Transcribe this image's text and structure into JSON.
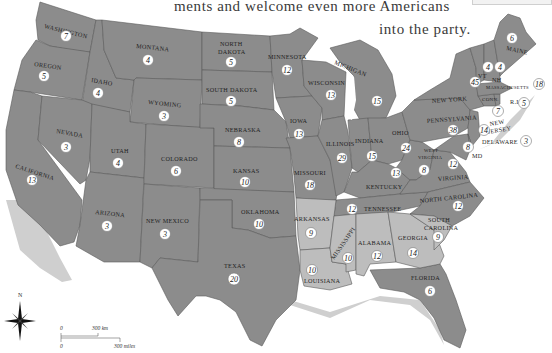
{
  "caption": {
    "line1": "ments and welcome even more Americans",
    "line2": "into the party."
  },
  "colors": {
    "dark_state": "#8c8c8c",
    "light_state": "#bdbdbd",
    "border": "#5a5a5a",
    "coast_shadow": "#c8c8c8",
    "background": "#ffffff"
  },
  "states": [
    {
      "name": "WASHINGTON",
      "votes": "7",
      "shade": "dark"
    },
    {
      "name": "OREGON",
      "votes": "5",
      "shade": "dark"
    },
    {
      "name": "CALIFORNIA",
      "votes": "13",
      "shade": "dark"
    },
    {
      "name": "IDAHO",
      "votes": "4",
      "shade": "dark"
    },
    {
      "name": "NEVADA",
      "votes": "3",
      "shade": "dark"
    },
    {
      "name": "MONTANA",
      "votes": "4",
      "shade": "dark"
    },
    {
      "name": "WYOMING",
      "votes": "3",
      "shade": "dark"
    },
    {
      "name": "UTAH",
      "votes": "4",
      "shade": "dark"
    },
    {
      "name": "ARIZONA",
      "votes": "3",
      "shade": "dark"
    },
    {
      "name": "COLORADO",
      "votes": "6",
      "shade": "dark"
    },
    {
      "name": "NEW MEXICO",
      "votes": "3",
      "shade": "dark"
    },
    {
      "name": "NORTH DAKOTA",
      "votes": "5",
      "shade": "dark"
    },
    {
      "name": "SOUTH DAKOTA",
      "votes": "5",
      "shade": "dark"
    },
    {
      "name": "NEBRASKA",
      "votes": "8",
      "shade": "dark"
    },
    {
      "name": "KANSAS",
      "votes": "10",
      "shade": "dark"
    },
    {
      "name": "OKLAHOMA",
      "votes": "10",
      "shade": "dark"
    },
    {
      "name": "TEXAS",
      "votes": "20",
      "shade": "dark"
    },
    {
      "name": "MINNESOTA",
      "votes": "12",
      "shade": "dark"
    },
    {
      "name": "IOWA",
      "votes": "13",
      "shade": "dark"
    },
    {
      "name": "MISSOURI",
      "votes": "18",
      "shade": "dark"
    },
    {
      "name": "ARKANSAS",
      "votes": "9",
      "shade": "light"
    },
    {
      "name": "LOUISIANA",
      "votes": "10",
      "shade": "light"
    },
    {
      "name": "WISCONSIN",
      "votes": "13",
      "shade": "dark"
    },
    {
      "name": "ILLINOIS",
      "votes": "29",
      "shade": "dark"
    },
    {
      "name": "MISSISSIPPI",
      "votes": "10",
      "shade": "light"
    },
    {
      "name": "MICHIGAN",
      "votes": "15",
      "shade": "dark"
    },
    {
      "name": "INDIANA",
      "votes": "15",
      "shade": "dark"
    },
    {
      "name": "KENTUCKY",
      "votes": "13",
      "shade": "dark"
    },
    {
      "name": "TENNESSEE",
      "votes": "12",
      "shade": "dark"
    },
    {
      "name": "ALABAMA",
      "votes": "12",
      "shade": "light"
    },
    {
      "name": "OHIO",
      "votes": "24",
      "shade": "dark"
    },
    {
      "name": "WEST VIRGINIA",
      "votes": "8",
      "shade": "dark"
    },
    {
      "name": "GEORGIA",
      "votes": "14",
      "shade": "light"
    },
    {
      "name": "FLORIDA",
      "votes": "6",
      "shade": "dark"
    },
    {
      "name": "SOUTH CAROLINA",
      "votes": "9",
      "shade": "light"
    },
    {
      "name": "NORTH CAROLINA",
      "votes": "12",
      "shade": "dark"
    },
    {
      "name": "VIRGINIA",
      "votes": "12",
      "shade": "dark"
    },
    {
      "name": "PENNSYLVANIA",
      "votes": "38",
      "shade": "dark"
    },
    {
      "name": "NEW YORK",
      "votes": "45",
      "shade": "dark"
    },
    {
      "name": "MD",
      "votes": "8",
      "shade": "dark"
    },
    {
      "name": "NEW JERSEY",
      "votes": "14",
      "shade": "dark"
    },
    {
      "name": "DELAWARE",
      "votes": "3",
      "shade": "dark"
    },
    {
      "name": "CONN.",
      "votes": "7",
      "shade": "dark"
    },
    {
      "name": "R.I.",
      "votes": "5",
      "shade": "dark"
    },
    {
      "name": "MASSACHUSETTS",
      "votes": "18",
      "shade": "dark"
    },
    {
      "name": "VT",
      "votes": "4",
      "shade": "dark"
    },
    {
      "name": "NH",
      "votes": "4",
      "shade": "dark"
    },
    {
      "name": "MAINE",
      "votes": "6",
      "shade": "dark"
    }
  ],
  "labels": {
    "wa": "WASHINGTON",
    "or": "OREGON",
    "ca": "CALIFORNIA",
    "id": "IDAHO",
    "nv": "NEVADA",
    "mt": "MONTANA",
    "wy": "WYOMING",
    "ut": "UTAH",
    "az": "ARIZONA",
    "co": "COLORADO",
    "nm": "NEW MEXICO",
    "nd1": "NORTH",
    "nd2": "DAKOTA",
    "sd": "SOUTH DAKOTA",
    "ne": "NEBRASKA",
    "ks": "KANSAS",
    "ok": "OKLAHOMA",
    "tx": "TEXAS",
    "mn": "MINNESOTA",
    "ia": "IOWA",
    "mo": "MISSOURI",
    "ar": "ARKANSAS",
    "la": "LOUISIANA",
    "wi": "WISCONSIN",
    "il": "ILLINOIS",
    "ms": "MISSISSIPPI",
    "mi": "MICHIGAN",
    "in": "INDIANA",
    "ky": "KENTUCKY",
    "tn": "TENNESSEE",
    "al": "ALABAMA",
    "oh": "OHIO",
    "wv1": "WEST",
    "wv2": "VIRGINIA",
    "ga": "GEORGIA",
    "fl": "FLORIDA",
    "sc1": "SOUTH",
    "sc2": "CAROLINA",
    "nc": "NORTH CAROLINA",
    "va": "VIRGINIA",
    "pa": "PENNSYLVANIA",
    "ny": "NEW YORK",
    "md": "MD",
    "nj1": "NEW",
    "nj2": "JERSEY",
    "de": "DELAWARE",
    "ct": "CONN.",
    "ri": "R.I.",
    "ma": "MASSACHUSETTS",
    "vt": "VT",
    "nh": "NH",
    "me": "MAINE"
  },
  "votes": {
    "wa": "7",
    "or": "5",
    "ca": "13",
    "id": "4",
    "nv": "3",
    "mt": "4",
    "wy": "3",
    "ut": "4",
    "az": "3",
    "co": "6",
    "nm": "3",
    "nd": "5",
    "sd": "5",
    "ne": "8",
    "ks": "10",
    "ok": "10",
    "tx": "20",
    "mn": "12",
    "ia": "13",
    "mo": "18",
    "ar": "9",
    "la": "10",
    "wi": "13",
    "il": "29",
    "ms": "10",
    "mi": "15",
    "in": "15",
    "ky": "13",
    "tn": "12",
    "al": "12",
    "oh": "24",
    "wv": "8",
    "ga": "14",
    "fl": "6",
    "sc": "9",
    "nc": "12",
    "va": "12",
    "pa": "38",
    "ny": "45",
    "md": "8",
    "nj": "14",
    "de": "3",
    "ct": "7",
    "ri": "5",
    "ma": "18",
    "vt": "4",
    "nh": "4",
    "me": "6"
  },
  "compass": {
    "north_label": "N"
  },
  "scale_bar": {
    "km_zero": "0",
    "km_label": "300 km",
    "mi_zero": "0",
    "mi_label": "300 miles"
  }
}
